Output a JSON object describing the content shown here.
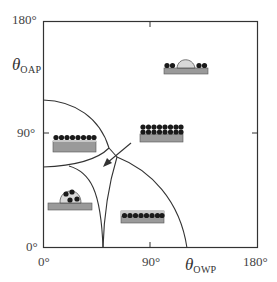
{
  "diagram": {
    "type": "wetting-regime phase diagram",
    "x_axis": {
      "symbol": "θ",
      "subscript": "OWP",
      "ticks": [
        "0°",
        "90°",
        "180°"
      ]
    },
    "y_axis": {
      "symbol": "θ",
      "subscript": "OAP",
      "ticks": [
        "0°",
        "90°",
        "180°"
      ]
    },
    "regions": [
      {
        "name": "particles-at-air-water-interface-layer",
        "illustration": "single row of particles on oil layer over substrate",
        "position": "upper-left"
      },
      {
        "name": "particle-multilayer-on-substrate",
        "illustration": "double row of particles on substrate",
        "position": "center-right"
      },
      {
        "name": "droplet-on-particle-layer",
        "illustration": "droplet resting between particles on substrate",
        "position": "upper-right"
      },
      {
        "name": "particles-inside-droplet",
        "illustration": "particles encapsulated in droplet on substrate",
        "position": "lower-left"
      },
      {
        "name": "particles-embedded-in-film",
        "illustration": "single row of particles embedded in film on substrate",
        "position": "lower-right"
      }
    ],
    "arrow": {
      "direction": "down-left",
      "meaning": "transition toward lower angles"
    }
  },
  "colors": {
    "line": "#333333",
    "substrate": "#9a9a9a",
    "film": "#c8c8c8",
    "particle": "#1a1a1a",
    "droplet": "#d9d9d9"
  }
}
